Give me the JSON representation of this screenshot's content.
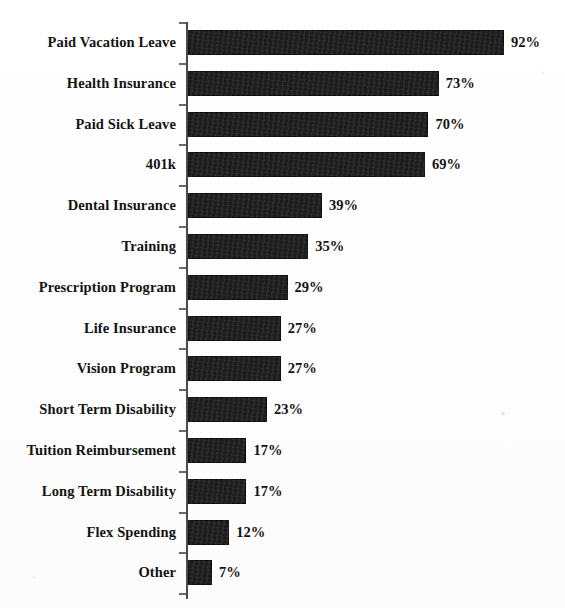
{
  "chart_data": {
    "type": "bar",
    "orientation": "horizontal",
    "title": "",
    "subtitle": "",
    "xlabel": "",
    "ylabel": "",
    "xlim": [
      0,
      100
    ],
    "grid": false,
    "legend": false,
    "value_suffix": "%",
    "categories": [
      "Paid Vacation Leave",
      "Health Insurance",
      "Paid Sick Leave",
      "401k",
      "Dental Insurance",
      "Training",
      "Prescription Program",
      "Life Insurance",
      "Vision Program",
      "Short Term Disability",
      "Tuition Reimbursement",
      "Long Term Disability",
      "Flex Spending",
      "Other"
    ],
    "values": [
      92,
      73,
      70,
      69,
      39,
      35,
      29,
      27,
      27,
      23,
      17,
      17,
      12,
      7
    ],
    "value_labels": [
      "92%",
      "73%",
      "70%",
      "69%",
      "39%",
      "35%",
      "29%",
      "27%",
      "27%",
      "23%",
      "17%",
      "17%",
      "12%",
      "7%"
    ],
    "bar_color": "#1c1c1c",
    "axis_color": "#4b4b4b",
    "text_color": "#131313",
    "background_color": "#ffffff"
  }
}
